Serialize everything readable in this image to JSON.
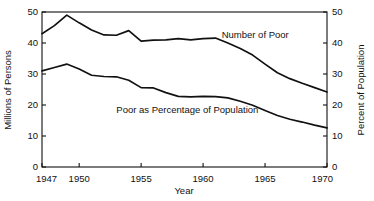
{
  "chart_data": {
    "type": "line",
    "title": "",
    "xlabel": "Year",
    "ylabel": "Millions of Persons",
    "y2label": "Percent of Population",
    "xlim": [
      1947,
      1970
    ],
    "ylim": [
      0,
      50
    ],
    "y2lim": [
      0,
      50
    ],
    "grid": false,
    "legend_position": "inline-annotations",
    "x_ticks_labeled": [
      "1947",
      "1950",
      "1955",
      "1960",
      "1965",
      "1970"
    ],
    "x_tick_values": [
      1947,
      1950,
      1955,
      1960,
      1965,
      1970
    ],
    "y_ticks": [
      "0",
      "10",
      "20",
      "30",
      "40",
      "50"
    ],
    "y_tick_values": [
      0,
      10,
      20,
      30,
      40,
      50
    ],
    "y2_ticks": [
      "0",
      "10",
      "20",
      "30",
      "40",
      "50"
    ],
    "y2_tick_values": [
      0,
      10,
      20,
      30,
      40,
      50
    ],
    "x": [
      1947,
      1948,
      1949,
      1950,
      1951,
      1952,
      1953,
      1954,
      1955,
      1956,
      1957,
      1958,
      1959,
      1960,
      1961,
      1962,
      1963,
      1964,
      1965,
      1966,
      1967,
      1968,
      1969,
      1970
    ],
    "series": [
      {
        "name": "Number of Poor",
        "axis": "left",
        "units": "millions of persons",
        "values": [
          43.0,
          45.6,
          49.0,
          46.5,
          44.2,
          42.6,
          42.5,
          44.0,
          40.6,
          40.9,
          41.0,
          41.4,
          41.0,
          41.4,
          41.6,
          40.0,
          38.2,
          36.1,
          33.2,
          30.4,
          28.5,
          27.0,
          25.6,
          24.2
        ]
      },
      {
        "name": "Poor as Percentage of Population",
        "axis": "right",
        "units": "percent of population",
        "values": [
          31.0,
          32.1,
          33.2,
          31.6,
          29.6,
          29.2,
          29.1,
          28.0,
          25.6,
          25.5,
          24.0,
          22.8,
          22.6,
          22.8,
          22.7,
          22.3,
          21.2,
          19.9,
          18.2,
          16.6,
          15.4,
          14.5,
          13.5,
          12.6
        ]
      }
    ],
    "annotations": [
      {
        "text": "Number of Poor",
        "x": 1961.5,
        "y": 41.5
      },
      {
        "text": "Poor as Percentage of Population",
        "x": 1953.0,
        "y": 17.5
      }
    ]
  }
}
